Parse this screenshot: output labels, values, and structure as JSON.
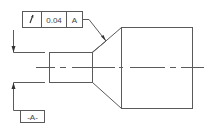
{
  "drawing": {
    "type": "gd&t-runout-callout",
    "feature_control_frame": {
      "symbol": "/",
      "symbol_name": "circular-runout",
      "tolerance": "0.04",
      "datum": "A"
    },
    "datum_label": "-A-",
    "colors": {
      "line": "#5a5a5a",
      "background": "#ffffff"
    }
  }
}
